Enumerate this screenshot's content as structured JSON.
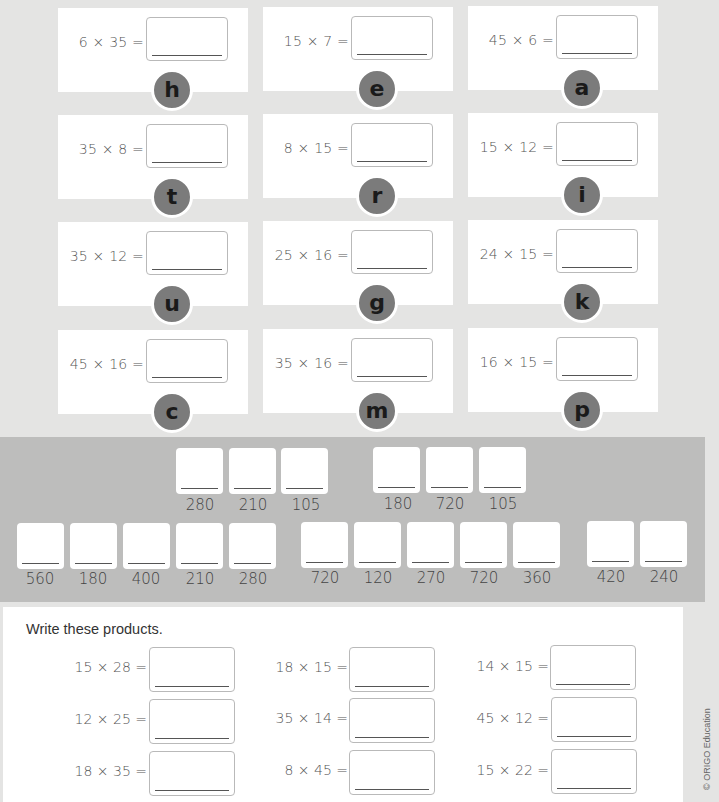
{
  "code_cards": [
    {
      "equation": "6 × 35 =",
      "letter": "h"
    },
    {
      "equation": "15 × 7 =",
      "letter": "e"
    },
    {
      "equation": "45 × 6 =",
      "letter": "a"
    },
    {
      "equation": "35 × 8 =",
      "letter": "t"
    },
    {
      "equation": "8 × 15 =",
      "letter": "r"
    },
    {
      "equation": "15 × 12 =",
      "letter": "i"
    },
    {
      "equation": "35 × 12 =",
      "letter": "u"
    },
    {
      "equation": "25 × 16 =",
      "letter": "g"
    },
    {
      "equation": "24 × 15 =",
      "letter": "k"
    },
    {
      "equation": "45 × 16 =",
      "letter": "c"
    },
    {
      "equation": "35 × 16 =",
      "letter": "m"
    },
    {
      "equation": "16 × 15 =",
      "letter": "p"
    }
  ],
  "decoder": {
    "row1": [
      "280",
      "210",
      "105",
      "180",
      "720",
      "105"
    ],
    "row2": [
      "560",
      "180",
      "400",
      "210",
      "280",
      "720",
      "120",
      "270",
      "720",
      "360",
      "420",
      "240"
    ]
  },
  "products": {
    "instruction": "Write these products.",
    "items": [
      "15 × 28 =",
      "18 × 15 =",
      "14 × 15 =",
      "12 × 25 =",
      "35 × 14 =",
      "45 × 12 =",
      "18 × 35 =",
      "8 × 45 =",
      "15 × 22 ="
    ]
  },
  "copyright": "© ORIGO Education",
  "colors": {
    "page_bg": "#e4e4e3",
    "band_bg": "#bdbdbc",
    "letter_circle": "#7b7b7b"
  }
}
